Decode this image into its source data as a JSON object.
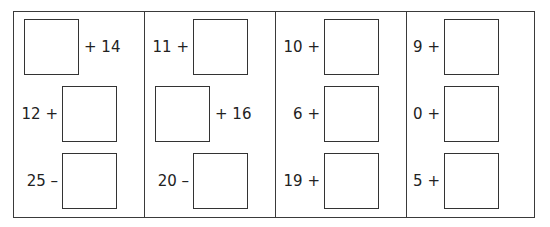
{
  "worksheet": {
    "columns": [
      {
        "problems": [
          {
            "left": "",
            "right": "+ 14",
            "layout": "box-first"
          },
          {
            "left": "12 +",
            "right": "",
            "layout": "text-first"
          },
          {
            "left": "25 –",
            "right": "",
            "layout": "text-first"
          }
        ]
      },
      {
        "problems": [
          {
            "left": "11 +",
            "right": "",
            "layout": "text-first"
          },
          {
            "left": "",
            "right": "+ 16",
            "layout": "box-first"
          },
          {
            "left": "20 –",
            "right": "",
            "layout": "text-first"
          }
        ]
      },
      {
        "problems": [
          {
            "left": "10 +",
            "right": "",
            "layout": "text-first"
          },
          {
            "left": "6 +",
            "right": "",
            "layout": "text-first"
          },
          {
            "left": "19 +",
            "right": "",
            "layout": "text-first"
          }
        ]
      },
      {
        "problems": [
          {
            "left": "9 +",
            "right": "",
            "layout": "text-first"
          },
          {
            "left": "0 +",
            "right": "",
            "layout": "text-first"
          },
          {
            "left": "5 +",
            "right": "",
            "layout": "text-first"
          }
        ]
      }
    ]
  }
}
